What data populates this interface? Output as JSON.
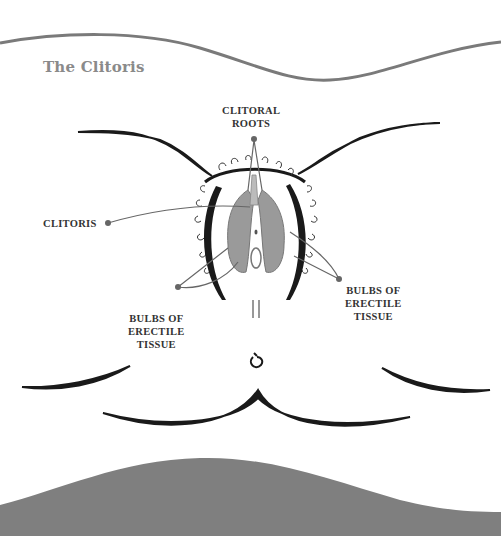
{
  "title": "The Clitoris",
  "labels": {
    "clitoral_roots": {
      "line1": "CLITORAL",
      "line2": "ROOTS"
    },
    "clitoris": {
      "line1": "CLITORIS"
    },
    "bulbs_left": {
      "line1": "BULBS OF",
      "line2": "ERECTILE",
      "line3": "TISSUE"
    },
    "bulbs_right": {
      "line1": "BULBS OF",
      "line2": "ERECTILE",
      "line3": "TISSUE"
    }
  },
  "colors": {
    "wave_line": "#7a7a7a",
    "bottom_band": "#7f7f7f",
    "ink": "#1a1a1a",
    "tissue": "#9a9a9a",
    "leader": "#666666"
  }
}
